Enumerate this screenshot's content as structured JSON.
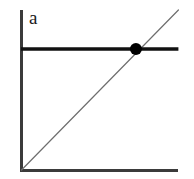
{
  "figure": {
    "panel_label": "a",
    "background_color": "#ffffff",
    "width": 194,
    "height": 179
  },
  "colors": {
    "axis": "#3b3b3b",
    "threshold_line": "#111111",
    "diagonal_line": "#6e6e6e",
    "marker": "#000000",
    "label_text": "#1a1a1a"
  },
  "chart_data": {
    "type": "line",
    "title": "",
    "xlabel": "",
    "ylabel": "",
    "xlim": [
      0,
      1
    ],
    "ylim": [
      0,
      1
    ],
    "grid": false,
    "legend": "none",
    "axes": {
      "y_axis": {
        "x": 0,
        "y_start": 0,
        "y_end": 1
      },
      "x_axis": {
        "y": 0,
        "x_start": 0,
        "x_end": 0.99
      }
    },
    "series": [
      {
        "name": "threshold",
        "style": "solid-thick",
        "color": "#111111",
        "x": [
          0,
          0.99
        ],
        "y": [
          0.756,
          0.756
        ]
      },
      {
        "name": "identity",
        "style": "solid-thin",
        "color": "#6e6e6e",
        "x": [
          0,
          0.99
        ],
        "y": [
          0,
          1.0
        ]
      }
    ],
    "points": [
      {
        "name": "intersection",
        "x": 0.722,
        "y": 0.756,
        "marker": "filled-circle",
        "size": 12,
        "color": "#000000"
      }
    ],
    "annotations": [
      {
        "name": "panel-label",
        "text": "a",
        "x": 0.05,
        "y": 0.96
      }
    ]
  }
}
